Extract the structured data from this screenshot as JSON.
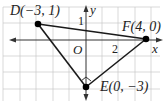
{
  "figure": {
    "type": "coordinate-plane-triangle",
    "axes": {
      "x_label": "x",
      "y_label": "y",
      "origin_label": "O",
      "tick_labels": {
        "x": [
          "2"
        ],
        "y": [
          "1"
        ]
      },
      "x_range": [
        -5,
        5
      ],
      "y_range": [
        -4,
        2
      ]
    },
    "points": [
      {
        "name": "D",
        "label": "D(−3, 1)",
        "x": -3,
        "y": 1
      },
      {
        "name": "F",
        "label": "F(4, 0)",
        "x": 4,
        "y": 0
      },
      {
        "name": "E",
        "label": "E(0, −3)",
        "x": 0,
        "y": -3
      }
    ],
    "segments": [
      [
        "D",
        "F"
      ],
      [
        "F",
        "E"
      ],
      [
        "E",
        "D"
      ]
    ],
    "right_angle_marker_at": "E",
    "colors": {
      "grid": "#c8c8c8",
      "axes": "#333333",
      "triangle": "#1a1a1a",
      "points": "#000000"
    }
  }
}
